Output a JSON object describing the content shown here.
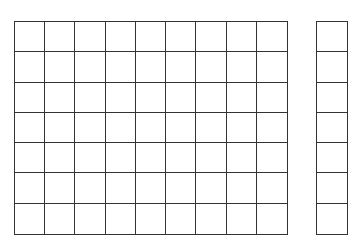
{
  "diagram": {
    "line_color": "#333333",
    "background": "#ffffff",
    "grids": [
      {
        "name": "main-grid",
        "rows": 7,
        "cols": 9
      },
      {
        "name": "side-grid",
        "rows": 7,
        "cols": 1
      }
    ]
  }
}
